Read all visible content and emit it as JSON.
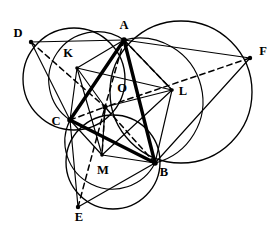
{
  "figure": {
    "stroke_color": "#000000",
    "background_color": "#ffffff",
    "width": 280,
    "height": 233
  },
  "points": {
    "A": {
      "label": "A",
      "x": 124,
      "y": 40,
      "label_x": 124,
      "label_y": 29
    },
    "B": {
      "label": "B",
      "x": 155,
      "y": 163,
      "label_x": 164,
      "label_y": 176
    },
    "C": {
      "label": "C",
      "x": 70,
      "y": 120,
      "label_x": 56,
      "label_y": 125
    },
    "D": {
      "label": "D",
      "x": 31,
      "y": 42,
      "label_x": 18,
      "label_y": 37
    },
    "E": {
      "label": "E",
      "x": 78,
      "y": 207,
      "label_x": 79,
      "label_y": 221
    },
    "F": {
      "label": "F",
      "x": 250,
      "y": 58,
      "label_x": 263,
      "label_y": 55
    },
    "K": {
      "label": "K",
      "x": 77,
      "y": 68,
      "label_x": 68,
      "label_y": 57
    },
    "L": {
      "label": "L",
      "x": 172,
      "y": 90,
      "label_x": 183,
      "label_y": 95
    },
    "M": {
      "label": "M",
      "x": 102,
      "y": 155,
      "label_x": 103,
      "label_y": 174
    },
    "O": {
      "label": "O",
      "x": 105,
      "y": 107,
      "label_x": 122,
      "label_y": 92
    }
  },
  "point_labels": [
    {
      "name": "label-A",
      "text": "A"
    },
    {
      "name": "label-B",
      "text": "B"
    },
    {
      "name": "label-C",
      "text": "C"
    },
    {
      "name": "label-D",
      "text": "D"
    },
    {
      "name": "label-E",
      "text": "E"
    },
    {
      "name": "label-F",
      "text": "F"
    },
    {
      "name": "label-K",
      "text": "K"
    },
    {
      "name": "label-L",
      "text": "L"
    },
    {
      "name": "label-M",
      "text": "M"
    },
    {
      "name": "label-O",
      "text": "O"
    }
  ],
  "circles": [
    {
      "name": "circumcircle-ACD",
      "through": "A, C, D",
      "cx": 74,
      "cy": 79,
      "r": 51
    },
    {
      "name": "circumcircle-ABF",
      "through": "A, B, F",
      "cx": 181,
      "cy": 92,
      "r": 71
    },
    {
      "name": "circumcircle-CBE",
      "through": "C, B, E",
      "cx": 113,
      "cy": 162,
      "r": 47
    }
  ],
  "segments": {
    "bold_triangle": [
      {
        "name": "segment-AB",
        "from": "A",
        "to": "B"
      },
      {
        "name": "segment-BC",
        "from": "B",
        "to": "C"
      },
      {
        "name": "segment-CA",
        "from": "C",
        "to": "A"
      }
    ],
    "thin_outer": [
      {
        "name": "segment-DA",
        "from": "D",
        "to": "A"
      },
      {
        "name": "segment-DC",
        "from": "D",
        "to": "C"
      },
      {
        "name": "segment-AF",
        "from": "A",
        "to": "F"
      },
      {
        "name": "segment-FB",
        "from": "F",
        "to": "B"
      },
      {
        "name": "segment-CE",
        "from": "C",
        "to": "E"
      },
      {
        "name": "segment-EB",
        "from": "E",
        "to": "B"
      }
    ],
    "thin_inner_triangle": [
      {
        "name": "segment-KL",
        "from": "K",
        "to": "L"
      },
      {
        "name": "segment-LM",
        "from": "L",
        "to": "M"
      },
      {
        "name": "segment-MK",
        "from": "M",
        "to": "K"
      }
    ],
    "thin_spokes": [
      {
        "name": "segment-KO",
        "from": "K",
        "to": "O"
      },
      {
        "name": "segment-LO",
        "from": "L",
        "to": "O"
      },
      {
        "name": "segment-MO",
        "from": "M",
        "to": "O"
      },
      {
        "name": "segment-KA",
        "from": "K",
        "to": "A"
      },
      {
        "name": "segment-KC",
        "from": "K",
        "to": "C"
      },
      {
        "name": "segment-LA",
        "from": "L",
        "to": "A"
      },
      {
        "name": "segment-LB",
        "from": "L",
        "to": "B"
      },
      {
        "name": "segment-MC",
        "from": "M",
        "to": "C"
      },
      {
        "name": "segment-MB",
        "from": "M",
        "to": "B"
      }
    ],
    "dashed": [
      {
        "name": "dashed-DO",
        "from": "D",
        "to": "O"
      },
      {
        "name": "dashed-FO",
        "from": "F",
        "to": "O"
      },
      {
        "name": "dashed-EO",
        "from": "E",
        "to": "O"
      },
      {
        "name": "dashed-AO",
        "from": "A",
        "to": "O"
      },
      {
        "name": "dashed-AL",
        "from": "A",
        "to": "L"
      },
      {
        "name": "dashed-CO",
        "from": "C",
        "to": "O"
      },
      {
        "name": "dashed-BO",
        "from": "B",
        "to": "O"
      },
      {
        "name": "dashed-OM",
        "from": "O",
        "to": "M"
      }
    ],
    "arcs": [
      {
        "name": "arc-AO-lens",
        "desc": "arc from A through center to C"
      },
      {
        "name": "arc-CO-lens",
        "desc": "arc from C through center to B"
      },
      {
        "name": "arc-BO-lens",
        "desc": "arc from B through center to A"
      }
    ]
  }
}
